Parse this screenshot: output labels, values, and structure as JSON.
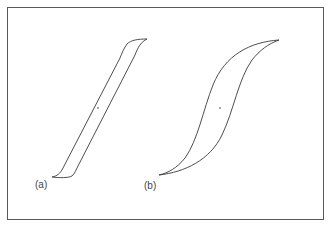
{
  "figure": {
    "labels": {
      "a": "(a)",
      "b": "(b)"
    },
    "colors": {
      "stroke": "#3a3a3a",
      "frame": "#5a5a5a",
      "background": "#ffffff"
    },
    "loops": [
      {
        "id": "a",
        "description": "narrow, steep hysteresis loop with square shoulders",
        "lower_tip": [
          52,
          177
        ],
        "upper_tip": [
          147,
          39
        ],
        "center_dot": [
          98,
          108
        ]
      },
      {
        "id": "b",
        "description": "wide, S-shaped hysteresis loop",
        "lower_tip": [
          159,
          175
        ],
        "upper_tip": [
          279,
          40
        ],
        "center_dot": [
          220,
          108
        ]
      }
    ]
  }
}
